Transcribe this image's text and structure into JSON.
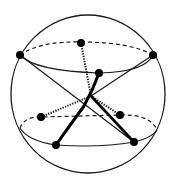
{
  "diagram": {
    "title": "Two tetrahedra inscribed in a sphere (stella-like configuration)",
    "colors": {
      "stroke": "#1a1a1a",
      "background": "#ffffff",
      "node": "#000000"
    },
    "sphere": {
      "cx": 88,
      "cy": 94,
      "rx": 77,
      "ry": 79
    },
    "center": {
      "x": 91,
      "y": 96
    },
    "upper_ring": {
      "cx": 86,
      "cy": 57,
      "rx": 67,
      "ry": 15
    },
    "lower_ring": {
      "cx": 88,
      "cy": 130,
      "rx": 70,
      "ry": 15
    },
    "nodes": [
      {
        "id": "upper-left",
        "x": 20,
        "y": 55,
        "ring": "upper",
        "visible_side": "front"
      },
      {
        "id": "upper-back",
        "x": 81,
        "y": 43,
        "ring": "upper",
        "visible_side": "back"
      },
      {
        "id": "upper-right",
        "x": 153,
        "y": 55,
        "ring": "upper",
        "visible_side": "front"
      },
      {
        "id": "upper-front",
        "x": 99,
        "y": 73,
        "ring": "upper",
        "visible_side": "front"
      },
      {
        "id": "lower-back-left",
        "x": 41,
        "y": 117,
        "ring": "lower",
        "visible_side": "back"
      },
      {
        "id": "lower-back-right",
        "x": 120,
        "y": 115,
        "ring": "lower",
        "visible_side": "back"
      },
      {
        "id": "lower-front-left",
        "x": 56,
        "y": 145,
        "ring": "lower",
        "visible_side": "front"
      },
      {
        "id": "lower-front-right",
        "x": 134,
        "y": 142,
        "ring": "lower",
        "visible_side": "front"
      }
    ],
    "edges": [
      {
        "from": "upper-left",
        "to": "lower-front-right",
        "style": "solid-thick"
      },
      {
        "from": "upper-right",
        "to": "center",
        "style": "solid-thin"
      },
      {
        "from": "upper-front",
        "to": "lower-front-left",
        "style": "solid-heavy"
      },
      {
        "from": "upper-back",
        "to": "center",
        "style": "dotted"
      },
      {
        "from": "lower-back-left",
        "to": "center",
        "style": "dotted"
      },
      {
        "from": "lower-back-right",
        "to": "center",
        "style": "dotted"
      }
    ]
  }
}
